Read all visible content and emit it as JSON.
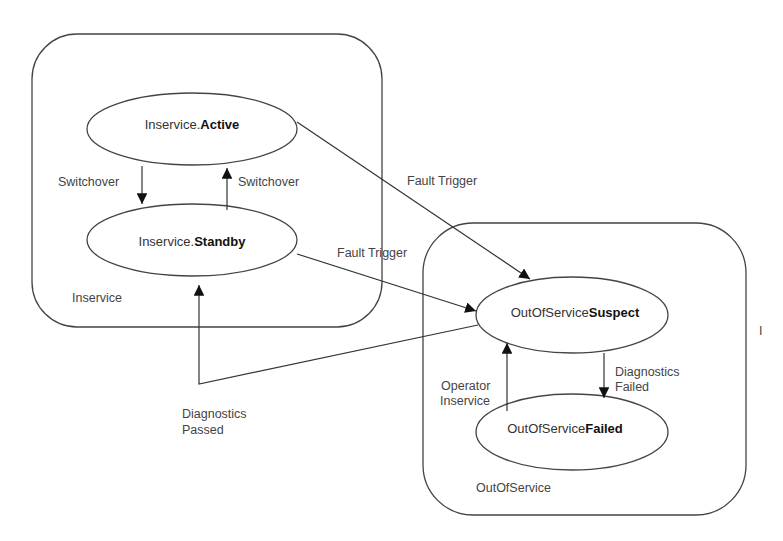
{
  "diagram": {
    "type": "state-machine",
    "groups": [
      {
        "id": "inservice",
        "label": "Inservice"
      },
      {
        "id": "outofservice",
        "label": "OutOfService"
      }
    ],
    "states": {
      "active": {
        "prefix": "Inservice.",
        "name": "Active"
      },
      "standby": {
        "prefix": "Inservice.",
        "name": "Standby"
      },
      "suspect": {
        "prefix": "OutOfService",
        "name": "Suspect"
      },
      "failed": {
        "prefix": "OutOfService",
        "name": "Failed"
      }
    },
    "transitions": {
      "active_to_standby": {
        "from": "active",
        "to": "standby",
        "label": "Switchover"
      },
      "standby_to_active": {
        "from": "standby",
        "to": "active",
        "label": "Switchover"
      },
      "active_to_suspect": {
        "from": "active",
        "to": "suspect",
        "label": "Fault Trigger"
      },
      "standby_to_suspect": {
        "from": "standby",
        "to": "suspect",
        "label": "Fault Trigger"
      },
      "suspect_to_standby": {
        "from": "suspect",
        "to": "standby",
        "label_line1": "Diagnostics",
        "label_line2": "Passed"
      },
      "suspect_to_failed": {
        "from": "suspect",
        "to": "failed",
        "label_line1": "Diagnostics",
        "label_line2": "Failed"
      },
      "failed_to_suspect": {
        "from": "failed",
        "to": "suspect",
        "label_line1": "Operator",
        "label_line2": "Inservice"
      }
    },
    "stray_mark": "I"
  }
}
